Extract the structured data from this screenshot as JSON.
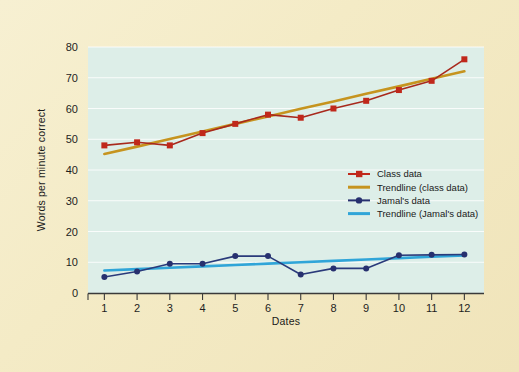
{
  "figure": {
    "background_color": "#f4ebc6",
    "plot_background_color": "#ddeee8"
  },
  "chart_data": {
    "type": "line",
    "title": "",
    "xlabel": "Dates",
    "ylabel": "Words per minute correct",
    "x": [
      1,
      2,
      3,
      4,
      5,
      6,
      7,
      8,
      9,
      10,
      11,
      12
    ],
    "xtick_labels": [
      "1",
      "2",
      "3",
      "4",
      "5",
      "6",
      "7",
      "8",
      "9",
      "10",
      "11",
      "12"
    ],
    "ytick_labels": [
      "0",
      "10",
      "20",
      "30",
      "40",
      "50",
      "60",
      "70",
      "80"
    ],
    "yticks": [
      0,
      10,
      20,
      30,
      40,
      50,
      60,
      70,
      80
    ],
    "xlim": [
      0.5,
      12.6
    ],
    "ylim": [
      0,
      80
    ],
    "grid": true,
    "legend_position": "center-right",
    "series": [
      {
        "name": "Class data",
        "kind": "markers-line",
        "color": "#a8291c",
        "marker": "square",
        "marker_color": "#c0281b",
        "values": [
          48,
          49,
          48,
          52,
          55,
          58,
          57,
          60,
          62.5,
          66,
          69,
          76
        ]
      },
      {
        "name": "Trendline (class data)",
        "kind": "line",
        "color": "#c6941f",
        "marker": "none",
        "values": [
          45.2,
          47.6,
          50.1,
          52.5,
          55.0,
          57.4,
          59.9,
          62.3,
          64.8,
          67.2,
          69.7,
          72.1
        ]
      },
      {
        "name": "Jamal's data",
        "kind": "markers-line",
        "color": "#2a3a7a",
        "marker": "circle",
        "marker_color": "#27306f",
        "values": [
          5.2,
          7,
          9.5,
          9.5,
          12,
          12,
          6,
          8,
          8,
          12.3,
          12.4,
          12.5
        ]
      },
      {
        "name": "Trendline (Jamal's data)",
        "kind": "line",
        "color": "#30a5d8",
        "marker": "none",
        "values": [
          7.3,
          7.75,
          8.2,
          8.65,
          9.1,
          9.55,
          10.0,
          10.45,
          10.9,
          11.35,
          11.8,
          12.25
        ]
      }
    ]
  },
  "legend": {
    "entries": [
      {
        "label": "Class data",
        "color": "#c0281b",
        "marker": "square"
      },
      {
        "label": "Trendline (class data)",
        "color": "#c6941f",
        "marker": "none"
      },
      {
        "label": "Jamal's data",
        "color": "#27306f",
        "marker": "circle"
      },
      {
        "label": "Trendline (Jamal's data)",
        "color": "#30a5d8",
        "marker": "none"
      }
    ]
  }
}
